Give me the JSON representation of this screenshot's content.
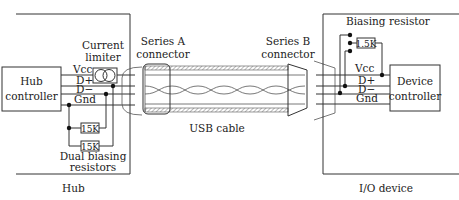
{
  "hub": {
    "label": "Hub",
    "controller": [
      "Hub",
      "controller"
    ],
    "current_limiter": [
      "Current",
      "limiter"
    ],
    "biasing": [
      "Dual biasing",
      "resistors"
    ],
    "resistors": [
      "15K",
      "15K"
    ],
    "lines": [
      "Vcc",
      "D+",
      "D−",
      "Gnd"
    ]
  },
  "cable": {
    "series_a": [
      "Series A",
      "connector"
    ],
    "series_b": [
      "Series B",
      "connector"
    ],
    "label": "USB cable"
  },
  "device": {
    "label": "I/O device",
    "controller": [
      "Device",
      "controller"
    ],
    "biasing": "Biasing resistor",
    "resistor": "1.5K",
    "lines": [
      "Vcc",
      "D+",
      "D−",
      "Gnd"
    ]
  }
}
